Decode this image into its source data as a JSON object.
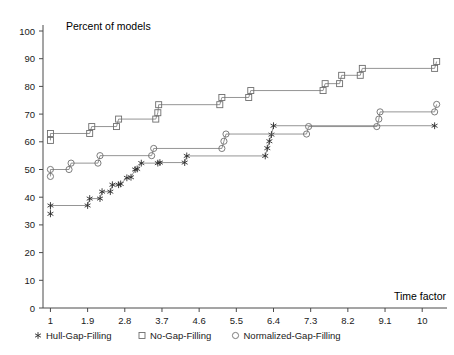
{
  "chart_data": {
    "type": "line",
    "title": "",
    "ylabel": "Percent of models",
    "xlabel": "Time factor",
    "xlim": [
      0.82,
      10.6
    ],
    "ylim": [
      0,
      100
    ],
    "grid": false,
    "legend_position": "bottom",
    "xticks": [
      "1",
      "1.9",
      "2.8",
      "3.7",
      "4.6",
      "5.5",
      "6.4",
      "7.3",
      "8.2",
      "9.1",
      "10"
    ],
    "xtick_values": [
      1,
      1.9,
      2.8,
      3.7,
      4.6,
      5.5,
      6.4,
      7.3,
      8.2,
      9.1,
      10
    ],
    "yticks": [
      "0",
      "10",
      "20",
      "30",
      "40",
      "50",
      "60",
      "70",
      "80",
      "90",
      "100"
    ],
    "ytick_values": [
      0,
      10,
      20,
      30,
      40,
      50,
      60,
      70,
      80,
      90,
      100
    ],
    "series": [
      {
        "name": "Hull-Gap-Filling",
        "marker": "asterisk",
        "color": "#2b2b2b",
        "points": [
          [
            1.0,
            34.0
          ],
          [
            1.0,
            37.0
          ],
          [
            1.9,
            37.0
          ],
          [
            1.95,
            39.5
          ],
          [
            2.2,
            39.5
          ],
          [
            2.25,
            42.0
          ],
          [
            2.45,
            42.0
          ],
          [
            2.5,
            44.5
          ],
          [
            2.65,
            44.5
          ],
          [
            2.7,
            44.8
          ],
          [
            2.85,
            47.0
          ],
          [
            2.95,
            47.2
          ],
          [
            3.05,
            50.0
          ],
          [
            3.1,
            50.2
          ],
          [
            3.2,
            52.3
          ],
          [
            3.6,
            52.3
          ],
          [
            3.65,
            52.5
          ],
          [
            4.25,
            52.5
          ],
          [
            4.3,
            54.9
          ],
          [
            6.2,
            54.9
          ],
          [
            6.25,
            57.7
          ],
          [
            6.3,
            60.2
          ],
          [
            6.35,
            62.6
          ],
          [
            6.4,
            65.8
          ],
          [
            10.3,
            65.8
          ]
        ]
      },
      {
        "name": "No-Gap-Filling",
        "marker": "square",
        "color": "#6e6e6e",
        "points": [
          [
            1.0,
            60.5
          ],
          [
            1.0,
            63.0
          ],
          [
            1.95,
            63.0
          ],
          [
            2.0,
            65.5
          ],
          [
            2.6,
            65.5
          ],
          [
            2.65,
            68.2
          ],
          [
            3.55,
            68.2
          ],
          [
            3.6,
            70.5
          ],
          [
            3.62,
            73.4
          ],
          [
            5.1,
            73.4
          ],
          [
            5.15,
            76.0
          ],
          [
            5.8,
            76.0
          ],
          [
            5.85,
            78.5
          ],
          [
            7.6,
            78.5
          ],
          [
            7.65,
            81.0
          ],
          [
            8.0,
            81.0
          ],
          [
            8.05,
            84.0
          ],
          [
            8.5,
            84.0
          ],
          [
            8.55,
            86.5
          ],
          [
            10.3,
            86.5
          ],
          [
            10.35,
            89.0
          ]
        ]
      },
      {
        "name": "Normalized-Gap-Filling",
        "marker": "circle",
        "color": "#6e6e6e",
        "points": [
          [
            1.0,
            47.5
          ],
          [
            1.0,
            50.0
          ],
          [
            1.45,
            50.0
          ],
          [
            1.5,
            52.3
          ],
          [
            2.15,
            52.3
          ],
          [
            2.2,
            55.0
          ],
          [
            3.45,
            55.0
          ],
          [
            3.5,
            57.6
          ],
          [
            5.15,
            57.6
          ],
          [
            5.2,
            60.2
          ],
          [
            5.25,
            62.8
          ],
          [
            7.2,
            62.8
          ],
          [
            7.25,
            65.5
          ],
          [
            8.9,
            65.5
          ],
          [
            8.95,
            68.2
          ],
          [
            8.98,
            70.8
          ],
          [
            10.3,
            70.8
          ],
          [
            10.35,
            73.5
          ]
        ]
      }
    ]
  },
  "axis": {
    "y_title": "Percent of models",
    "x_title": "Time factor"
  },
  "legend": {
    "items": [
      {
        "label": "Hull-Gap-Filling",
        "marker": "asterisk-marker"
      },
      {
        "label": "No-Gap-Filling",
        "marker": "square-marker"
      },
      {
        "label": "Normalized-Gap-Filling",
        "marker": "circle-marker"
      }
    ]
  }
}
